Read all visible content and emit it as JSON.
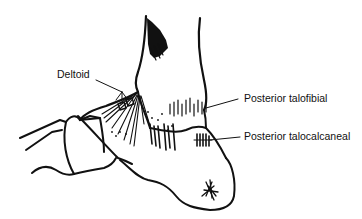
{
  "figure": {
    "labels": [
      {
        "id": "deltoid",
        "text": "Deltoid",
        "x": 57,
        "y": 68
      },
      {
        "id": "posterior-talofibial",
        "text": "Posterior talofibial",
        "x": 244,
        "y": 92
      },
      {
        "id": "posterior-talocalcaneal",
        "text": "Posterior talocalcaneal",
        "x": 244,
        "y": 130
      }
    ],
    "colors": {
      "ink": "#111111",
      "background": "#ffffff"
    }
  }
}
